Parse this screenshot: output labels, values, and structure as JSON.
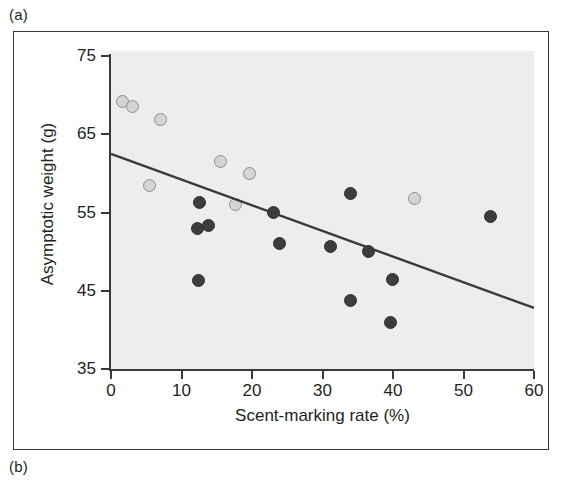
{
  "figure": {
    "panel_a_label": "(a)",
    "panel_b_label": "(b)"
  },
  "chart_data": {
    "type": "scatter",
    "title": "",
    "subtitle": "",
    "xlabel": "Scent-marking rate (%)",
    "ylabel": "Asymptotic weight (g)",
    "xlim": [
      0,
      60
    ],
    "ylim": [
      35,
      75
    ],
    "xticks": [
      0,
      10,
      20,
      30,
      40,
      50,
      60
    ],
    "yticks": [
      35,
      45,
      55,
      65,
      75
    ],
    "xtick_labels": [
      "0",
      "10",
      "20",
      "30",
      "40",
      "50",
      "60"
    ],
    "ytick_labels": [
      "35",
      "45",
      "55",
      "65",
      "75"
    ],
    "grid": false,
    "legend_position": "none",
    "plot_background_color": "#eceded",
    "axis_color": "#3a3a3c",
    "series": [
      {
        "name": "light-group",
        "marker": "open-circle",
        "color": "#d3d4d4",
        "edge_color": "#8d8e90",
        "points": [
          {
            "x": 1.6,
            "y": 69.2
          },
          {
            "x": 3.0,
            "y": 68.6
          },
          {
            "x": 7.0,
            "y": 66.9
          },
          {
            "x": 5.4,
            "y": 58.5
          },
          {
            "x": 15.6,
            "y": 61.5
          },
          {
            "x": 19.7,
            "y": 60.0
          },
          {
            "x": 17.7,
            "y": 56.0
          },
          {
            "x": 43.0,
            "y": 56.8
          }
        ]
      },
      {
        "name": "dark-group",
        "marker": "filled-circle",
        "color": "#3d3d3f",
        "edge_color": "#2e2e30",
        "points": [
          {
            "x": 12.5,
            "y": 56.3
          },
          {
            "x": 12.3,
            "y": 53.0
          },
          {
            "x": 13.8,
            "y": 53.4
          },
          {
            "x": 12.4,
            "y": 46.3
          },
          {
            "x": 23.0,
            "y": 55.0
          },
          {
            "x": 23.9,
            "y": 51.0
          },
          {
            "x": 31.2,
            "y": 50.6
          },
          {
            "x": 34.0,
            "y": 57.4
          },
          {
            "x": 36.5,
            "y": 50.0
          },
          {
            "x": 34.0,
            "y": 43.7
          },
          {
            "x": 39.9,
            "y": 46.4
          },
          {
            "x": 39.7,
            "y": 40.9
          },
          {
            "x": 53.8,
            "y": 54.5
          }
        ]
      }
    ],
    "trend_line": {
      "name": "regression-line",
      "color": "#3a3a3c",
      "width": 2.4,
      "x_start": 0,
      "y_start": 62.5,
      "x_end": 60,
      "y_end": 42.8
    }
  }
}
